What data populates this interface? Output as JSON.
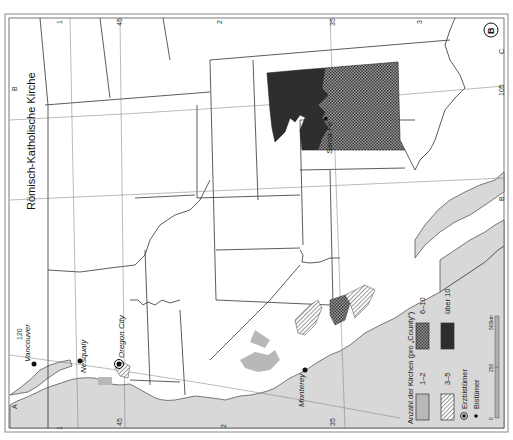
{
  "title": "Römisch-Katholische Kirche",
  "panel_badge": "B",
  "grid_letters": {
    "left_top": "A",
    "left_mid": "B",
    "right_mid": "B",
    "right_top": "C"
  },
  "grid_numbers": {
    "top": [
      "1",
      "45",
      "2",
      "35",
      "3"
    ],
    "bottom": [
      "1",
      "45",
      "2",
      "35"
    ]
  },
  "longitude_labels": [
    "120",
    "105"
  ],
  "cities": [
    {
      "name": "Vancouver",
      "type": "bistum"
    },
    {
      "name": "Nesqualy",
      "type": "bistum"
    },
    {
      "name": "Oregon City",
      "type": "erzbistum"
    },
    {
      "name": "Monterey",
      "type": "bistum"
    },
    {
      "name": "Santa Fe",
      "type": "bistum"
    }
  ],
  "legend": {
    "heading": "Anzahl der Kirchen (pro „County“)",
    "classes": [
      {
        "label": "1–2",
        "fill": "light-gray"
      },
      {
        "label": "3–5",
        "fill": "hatched"
      },
      {
        "label": "6–10",
        "fill": "dotted-dark"
      },
      {
        "label": "über 10",
        "fill": "black"
      }
    ],
    "symbols": [
      {
        "label": "Erzbistümer",
        "symbol": "ringed-dot"
      },
      {
        "label": "Bistümer",
        "symbol": "dot"
      }
    ],
    "scale": {
      "labels": [
        "0",
        "250",
        "500km"
      ]
    }
  },
  "colors": {
    "water": "#d8d8d8",
    "county_light": "#b8b8b8",
    "over10": "#2e2e2e",
    "border": "#333333"
  }
}
